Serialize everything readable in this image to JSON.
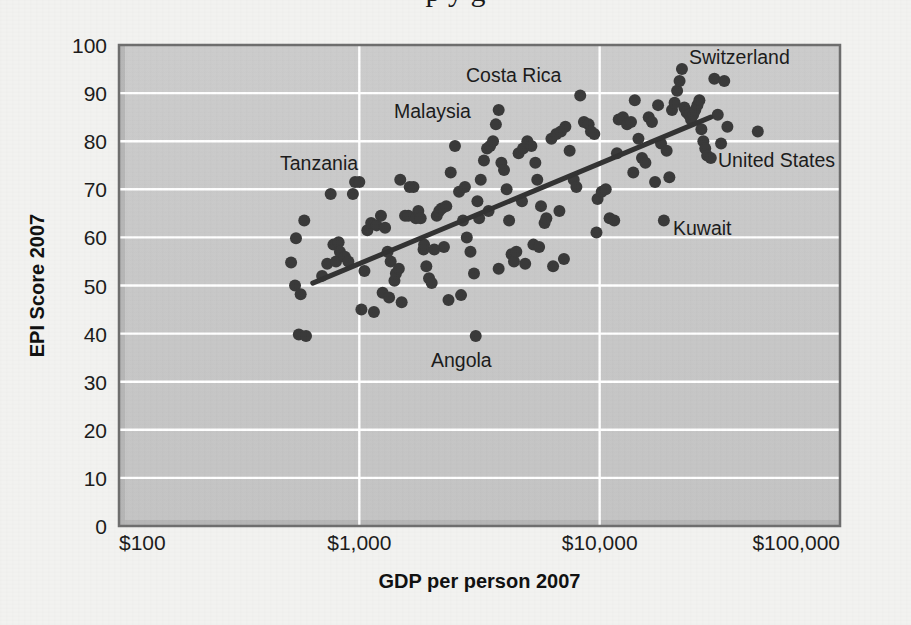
{
  "page": {
    "background_color": "#f2f2f0",
    "cropped_title_fragment": "p     y    g"
  },
  "chart_data": {
    "type": "scatter",
    "title": "",
    "xlabel": "GDP per person 2007",
    "ylabel": "EPI Score 2007",
    "x_scale": "log",
    "xlim": [
      100,
      100000
    ],
    "ylim": [
      0,
      100
    ],
    "x_tick_labels": [
      "$100",
      "$1,000",
      "$10,000",
      "$100,000"
    ],
    "x_tick_values": [
      100,
      1000,
      10000,
      100000
    ],
    "y_tick_labels": [
      "0",
      "10",
      "20",
      "30",
      "40",
      "50",
      "60",
      "70",
      "80",
      "90",
      "100"
    ],
    "y_tick_values": [
      0,
      10,
      20,
      30,
      40,
      50,
      60,
      70,
      80,
      90,
      100
    ],
    "grid": "horizontal-and-vertical-white",
    "legend": "none",
    "plot_background_color": "#c8c8c8",
    "gridline_color": "#ffffff",
    "point_color": "#3a3a3a",
    "point_radius_px": 6,
    "trendline": {
      "color": "#333333",
      "width_px": 5,
      "x_start": 640,
      "y_start": 50.5,
      "x_end": 29000,
      "y_end": 85.0
    },
    "annotations": [
      {
        "label": "Tanzania",
        "x_px": 280,
        "y_px": 170,
        "anchor": "start"
      },
      {
        "label": "Malaysia",
        "x_px": 394,
        "y_px": 118,
        "anchor": "start"
      },
      {
        "label": "Costa Rica",
        "x_px": 466,
        "y_px": 82,
        "anchor": "start"
      },
      {
        "label": "Switzerland",
        "x_px": 689,
        "y_px": 64,
        "anchor": "start"
      },
      {
        "label": "United States",
        "x_px": 718,
        "y_px": 167,
        "anchor": "start"
      },
      {
        "label": "Kuwait",
        "x_px": 673,
        "y_px": 235,
        "anchor": "start"
      },
      {
        "label": "Angola",
        "x_px": 431,
        "y_px": 367,
        "anchor": "start"
      }
    ],
    "highlighted_points": [
      {
        "name": "United States",
        "x": 45500,
        "y": 82
      },
      {
        "name": "Kuwait",
        "x": 18500,
        "y": 63.5
      },
      {
        "name": "Angola",
        "x": 3050,
        "y": 39.5
      }
    ],
    "points": [
      {
        "x": 590,
        "y": 63.5
      },
      {
        "x": 545,
        "y": 59.8
      },
      {
        "x": 520,
        "y": 54.8
      },
      {
        "x": 540,
        "y": 50.0
      },
      {
        "x": 570,
        "y": 48.2
      },
      {
        "x": 560,
        "y": 39.8
      },
      {
        "x": 600,
        "y": 39.5
      },
      {
        "x": 700,
        "y": 52.0
      },
      {
        "x": 735,
        "y": 54.5
      },
      {
        "x": 800,
        "y": 55.0
      },
      {
        "x": 780,
        "y": 58.5
      },
      {
        "x": 820,
        "y": 59.0
      },
      {
        "x": 830,
        "y": 57.0
      },
      {
        "x": 870,
        "y": 56.0
      },
      {
        "x": 900,
        "y": 55.0
      },
      {
        "x": 940,
        "y": 69.0
      },
      {
        "x": 960,
        "y": 71.5
      },
      {
        "x": 1000,
        "y": 71.5
      },
      {
        "x": 1020,
        "y": 45.0
      },
      {
        "x": 1150,
        "y": 44.5
      },
      {
        "x": 1080,
        "y": 61.5
      },
      {
        "x": 1120,
        "y": 63.0
      },
      {
        "x": 1180,
        "y": 62.5
      },
      {
        "x": 1230,
        "y": 64.5
      },
      {
        "x": 1280,
        "y": 62.0
      },
      {
        "x": 1310,
        "y": 57.0
      },
      {
        "x": 1350,
        "y": 55.0
      },
      {
        "x": 1400,
        "y": 51.0
      },
      {
        "x": 1420,
        "y": 52.5
      },
      {
        "x": 1460,
        "y": 53.5
      },
      {
        "x": 1500,
        "y": 46.5
      },
      {
        "x": 1550,
        "y": 64.5
      },
      {
        "x": 1600,
        "y": 64.5
      },
      {
        "x": 1620,
        "y": 70.5
      },
      {
        "x": 1680,
        "y": 70.5
      },
      {
        "x": 1720,
        "y": 64.0
      },
      {
        "x": 1760,
        "y": 65.5
      },
      {
        "x": 1800,
        "y": 64.0
      },
      {
        "x": 1850,
        "y": 57.5
      },
      {
        "x": 1900,
        "y": 54.0
      },
      {
        "x": 1950,
        "y": 51.5
      },
      {
        "x": 2000,
        "y": 50.5
      },
      {
        "x": 2100,
        "y": 64.5
      },
      {
        "x": 2150,
        "y": 65.5
      },
      {
        "x": 2200,
        "y": 66.0
      },
      {
        "x": 2300,
        "y": 66.5
      },
      {
        "x": 2400,
        "y": 73.5
      },
      {
        "x": 2500,
        "y": 79.0
      },
      {
        "x": 2600,
        "y": 69.5
      },
      {
        "x": 2700,
        "y": 63.5
      },
      {
        "x": 2800,
        "y": 60.0
      },
      {
        "x": 2900,
        "y": 57.0
      },
      {
        "x": 3000,
        "y": 52.5
      },
      {
        "x": 3100,
        "y": 67.5
      },
      {
        "x": 3200,
        "y": 72.0
      },
      {
        "x": 3300,
        "y": 76.0
      },
      {
        "x": 3400,
        "y": 78.5
      },
      {
        "x": 3500,
        "y": 79.0
      },
      {
        "x": 3600,
        "y": 80.0
      },
      {
        "x": 3700,
        "y": 83.5
      },
      {
        "x": 3800,
        "y": 86.5
      },
      {
        "x": 3900,
        "y": 75.5
      },
      {
        "x": 4000,
        "y": 74.0
      },
      {
        "x": 4100,
        "y": 70.0
      },
      {
        "x": 4200,
        "y": 63.5
      },
      {
        "x": 4300,
        "y": 56.5
      },
      {
        "x": 4400,
        "y": 55.0
      },
      {
        "x": 4600,
        "y": 77.5
      },
      {
        "x": 4800,
        "y": 78.5
      },
      {
        "x": 5000,
        "y": 80.0
      },
      {
        "x": 5200,
        "y": 79.0
      },
      {
        "x": 5400,
        "y": 75.5
      },
      {
        "x": 5500,
        "y": 72.0
      },
      {
        "x": 5700,
        "y": 66.5
      },
      {
        "x": 5900,
        "y": 63.0
      },
      {
        "x": 6000,
        "y": 64.0
      },
      {
        "x": 6300,
        "y": 80.5
      },
      {
        "x": 6600,
        "y": 81.5
      },
      {
        "x": 6900,
        "y": 82.0
      },
      {
        "x": 7200,
        "y": 83.0
      },
      {
        "x": 7500,
        "y": 78.0
      },
      {
        "x": 7800,
        "y": 72.0
      },
      {
        "x": 8000,
        "y": 70.5
      },
      {
        "x": 8300,
        "y": 89.5
      },
      {
        "x": 8600,
        "y": 84.0
      },
      {
        "x": 9000,
        "y": 83.5
      },
      {
        "x": 9500,
        "y": 81.5
      },
      {
        "x": 9800,
        "y": 68.0
      },
      {
        "x": 10200,
        "y": 69.5
      },
      {
        "x": 10600,
        "y": 70.0
      },
      {
        "x": 11000,
        "y": 64.0
      },
      {
        "x": 11500,
        "y": 63.5
      },
      {
        "x": 12000,
        "y": 84.5
      },
      {
        "x": 12500,
        "y": 85.0
      },
      {
        "x": 13000,
        "y": 83.5
      },
      {
        "x": 13500,
        "y": 84.0
      },
      {
        "x": 14000,
        "y": 88.5
      },
      {
        "x": 14500,
        "y": 80.5
      },
      {
        "x": 15000,
        "y": 76.5
      },
      {
        "x": 15500,
        "y": 75.5
      },
      {
        "x": 16000,
        "y": 85.0
      },
      {
        "x": 16500,
        "y": 84.0
      },
      {
        "x": 17500,
        "y": 87.5
      },
      {
        "x": 18000,
        "y": 79.5
      },
      {
        "x": 19000,
        "y": 78.0
      },
      {
        "x": 20000,
        "y": 86.5
      },
      {
        "x": 20500,
        "y": 88.0
      },
      {
        "x": 21000,
        "y": 90.5
      },
      {
        "x": 21500,
        "y": 92.5
      },
      {
        "x": 22000,
        "y": 95.0
      },
      {
        "x": 22500,
        "y": 87.0
      },
      {
        "x": 23000,
        "y": 86.0
      },
      {
        "x": 23500,
        "y": 85.5
      },
      {
        "x": 24000,
        "y": 84.5
      },
      {
        "x": 24500,
        "y": 85.5
      },
      {
        "x": 25000,
        "y": 86.5
      },
      {
        "x": 25500,
        "y": 87.5
      },
      {
        "x": 26000,
        "y": 88.5
      },
      {
        "x": 26500,
        "y": 82.5
      },
      {
        "x": 27000,
        "y": 80.0
      },
      {
        "x": 27500,
        "y": 78.5
      },
      {
        "x": 28000,
        "y": 77.0
      },
      {
        "x": 29000,
        "y": 76.5
      },
      {
        "x": 30000,
        "y": 93.0
      },
      {
        "x": 31000,
        "y": 85.5
      },
      {
        "x": 32000,
        "y": 79.5
      },
      {
        "x": 33000,
        "y": 92.5
      },
      {
        "x": 34000,
        "y": 83.0
      },
      {
        "x": 5300,
        "y": 58.5
      },
      {
        "x": 5600,
        "y": 58.0
      },
      {
        "x": 4500,
        "y": 57.0
      },
      {
        "x": 3450,
        "y": 65.5
      },
      {
        "x": 3150,
        "y": 64.0
      },
      {
        "x": 2250,
        "y": 58.0
      },
      {
        "x": 2050,
        "y": 57.5
      },
      {
        "x": 1250,
        "y": 48.5
      },
      {
        "x": 1330,
        "y": 47.5
      },
      {
        "x": 760,
        "y": 69.0
      },
      {
        "x": 1480,
        "y": 72.0
      },
      {
        "x": 2750,
        "y": 70.5
      },
      {
        "x": 4750,
        "y": 67.5
      },
      {
        "x": 6800,
        "y": 65.5
      },
      {
        "x": 9200,
        "y": 82.0
      },
      {
        "x": 13800,
        "y": 73.5
      },
      {
        "x": 2350,
        "y": 47.0
      },
      {
        "x": 1860,
        "y": 58.5
      },
      {
        "x": 1050,
        "y": 53.0
      },
      {
        "x": 3800,
        "y": 53.5
      },
      {
        "x": 4900,
        "y": 54.5
      },
      {
        "x": 6400,
        "y": 54.0
      },
      {
        "x": 7100,
        "y": 55.5
      },
      {
        "x": 2650,
        "y": 48.0
      },
      {
        "x": 9700,
        "y": 61.0
      },
      {
        "x": 11800,
        "y": 77.5
      },
      {
        "x": 19500,
        "y": 72.5
      },
      {
        "x": 17000,
        "y": 71.5
      }
    ]
  }
}
